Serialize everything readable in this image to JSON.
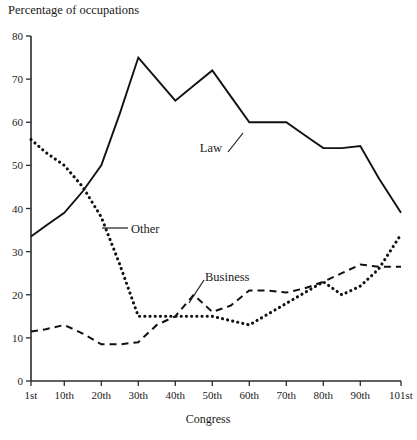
{
  "chart_data": {
    "type": "line",
    "title": "Percentage of occupations",
    "xlabel": "Congress",
    "ylabel": "",
    "ylim": [
      0,
      80
    ],
    "ytick_labels": [
      "0",
      "10",
      "20",
      "30",
      "40",
      "50",
      "60",
      "70",
      "80"
    ],
    "ytick_values": [
      0,
      10,
      20,
      30,
      40,
      50,
      60,
      70,
      80
    ],
    "categories": [
      "1st",
      "10th",
      "20th",
      "30th",
      "40th",
      "50th",
      "60th",
      "70th",
      "80th",
      "90th",
      "101st"
    ],
    "x": [
      1,
      10,
      20,
      30,
      40,
      50,
      60,
      70,
      80,
      90,
      101
    ],
    "grid": false,
    "legend_position": "inline-annotations",
    "series": [
      {
        "name": "Law",
        "style": "solid",
        "x": [
          1,
          5,
          10,
          15,
          20,
          25,
          30,
          35,
          40,
          45,
          50,
          55,
          60,
          65,
          70,
          75,
          80,
          85,
          90,
          95,
          101
        ],
        "values": [
          33.5,
          36,
          39,
          44,
          50,
          62,
          75,
          70,
          65,
          68.5,
          72,
          66,
          60,
          60,
          60,
          57,
          54,
          54,
          54.5,
          47,
          39
        ]
      },
      {
        "name": "Other",
        "style": "dotted",
        "x": [
          1,
          5,
          10,
          15,
          20,
          25,
          30,
          35,
          40,
          45,
          50,
          55,
          60,
          65,
          70,
          75,
          80,
          85,
          90,
          95,
          101
        ],
        "values": [
          56,
          53,
          50,
          45,
          38,
          27,
          15,
          15,
          15,
          15,
          15,
          14,
          13,
          15.5,
          18,
          20.5,
          23,
          20,
          22,
          26,
          34
        ]
      },
      {
        "name": "Business",
        "style": "dashed",
        "x": [
          1,
          5,
          10,
          15,
          20,
          25,
          30,
          35,
          40,
          45,
          50,
          55,
          60,
          65,
          70,
          75,
          80,
          85,
          90,
          95,
          101
        ],
        "values": [
          11.5,
          12,
          13,
          11,
          8.5,
          8.5,
          9,
          13,
          15,
          20,
          16,
          17.5,
          21,
          21,
          20.5,
          21.5,
          23,
          25,
          27,
          26.5,
          26.5
        ]
      }
    ],
    "annotations": [
      {
        "text": "Law",
        "series": "Law"
      },
      {
        "text": "Other",
        "series": "Other"
      },
      {
        "text": "Business",
        "series": "Business"
      }
    ]
  }
}
